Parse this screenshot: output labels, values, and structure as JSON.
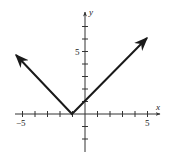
{
  "chart_data": {
    "type": "line",
    "title": "",
    "function": "y = |x + 1|",
    "xlabel": "x",
    "ylabel": "y",
    "xlim": [
      -6,
      5.8
    ],
    "ylim": [
      -3,
      8
    ],
    "x_tick_labels": [
      "-5",
      "5"
    ],
    "y_tick_labels": [
      "5"
    ],
    "x_ticks": [
      -5,
      -4,
      -3,
      -2,
      -1,
      1,
      2,
      3,
      4,
      5
    ],
    "y_ticks": [
      -2,
      -1,
      1,
      2,
      3,
      4,
      5,
      6,
      7
    ],
    "grid": false,
    "series": [
      {
        "name": "y=|x+1|",
        "x": [
          -5.5,
          -1,
          5
        ],
        "y": [
          4.5,
          0,
          6
        ],
        "arrows_both_ends": true
      }
    ],
    "vertex": {
      "x": -1,
      "y": 0
    },
    "color": "#1a1a1a"
  },
  "labels": {
    "x_axis": "x",
    "y_axis": "y",
    "x_neg": "−5",
    "x_pos": "5",
    "y_pos": "5"
  }
}
